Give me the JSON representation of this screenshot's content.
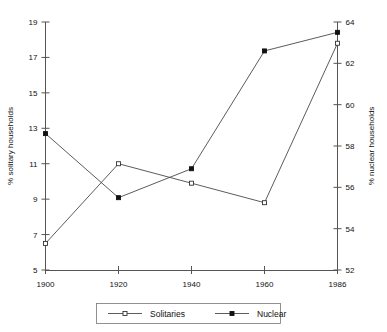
{
  "chart_data": {
    "type": "line",
    "title": "",
    "xlabel": "",
    "categories": [
      "1900",
      "1920",
      "1940",
      "1960",
      "1986"
    ],
    "x": [
      1900,
      1920,
      1940,
      1960,
      1986
    ],
    "grid": false,
    "legend_position": "bottom",
    "axes": {
      "left": {
        "label": "% solitary households",
        "ylim": [
          5,
          19
        ],
        "ticks": [
          5,
          7,
          9,
          11,
          13,
          15,
          17,
          19
        ],
        "ticklabels": [
          "5",
          "7",
          "9",
          "11",
          "13",
          "15",
          "17",
          "19"
        ]
      },
      "right": {
        "label": "% nuclear households",
        "ylim": [
          52,
          64
        ],
        "ticks": [
          52,
          54,
          56,
          58,
          60,
          62,
          64
        ],
        "ticklabels": [
          "52",
          "54",
          "56",
          "58",
          "60",
          "62",
          "64"
        ]
      },
      "x": {
        "ticklabels": [
          "1900",
          "1920",
          "1940",
          "1960",
          "1986"
        ]
      }
    },
    "series": [
      {
        "name": "Solitaries",
        "axis": "left",
        "marker": "open-square",
        "values": [
          6.5,
          11.0,
          9.9,
          8.8,
          17.8
        ]
      },
      {
        "name": "Nuclear",
        "axis": "right",
        "marker": "filled-square",
        "values": [
          58.6,
          55.5,
          56.9,
          62.6,
          63.5
        ]
      }
    ],
    "legend": [
      {
        "label": "Solitaries",
        "marker": "open-square"
      },
      {
        "label": "Nuclear",
        "marker": "filled-square"
      }
    ],
    "colors": {
      "line": "#4a4a4a",
      "axis": "#555555",
      "marker_fill_open": "#ffffff",
      "marker_fill_filled": "#111111",
      "background": "#ffffff"
    }
  }
}
